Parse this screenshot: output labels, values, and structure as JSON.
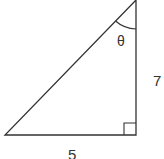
{
  "diagram": {
    "type": "right-triangle",
    "angle_label": "θ",
    "vertical_side_label": "7",
    "horizontal_side_label": "5",
    "right_angle_marker": true,
    "stroke_color": "#333333",
    "background_color": "#ffffff"
  }
}
